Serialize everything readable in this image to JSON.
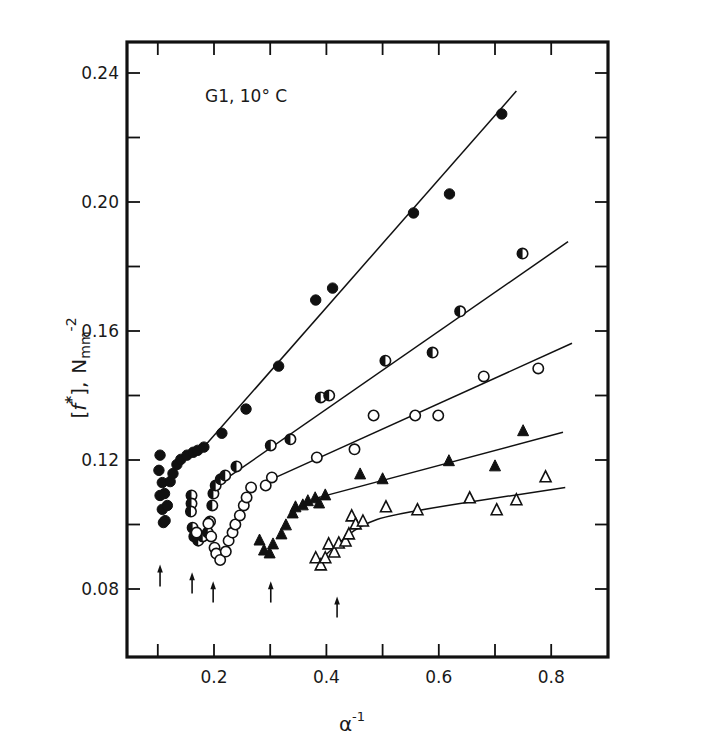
{
  "chart_data": {
    "type": "scatter",
    "title": "",
    "annotation": "G1,  10° C",
    "xlabel": "α⁻¹",
    "xlabel_base": "α",
    "xlabel_sup": "-1",
    "ylabel": "[f*], N mm⁻²",
    "ylabel_parts": {
      "bracket_open": "[",
      "f": "f",
      "star": "*",
      "bracket_close": "],",
      "unit": "N",
      "unit_sub": "mm",
      "unit_sup": "-2"
    },
    "xlim": [
      0.045,
      0.9
    ],
    "ylim": [
      0.059,
      0.25
    ],
    "x_ticks": [
      0.1,
      0.2,
      0.3,
      0.4,
      0.5,
      0.6,
      0.7,
      0.8
    ],
    "x_tick_labels": [
      {
        "value": 0.2,
        "label": "0.2"
      },
      {
        "value": 0.4,
        "label": "0.4"
      },
      {
        "value": 0.6,
        "label": "0.6"
      },
      {
        "value": 0.8,
        "label": "0.8"
      }
    ],
    "y_ticks": [
      0.08,
      0.1,
      0.12,
      0.14,
      0.16,
      0.18,
      0.2,
      0.22,
      0.24
    ],
    "y_tick_labels": [
      {
        "value": 0.24,
        "label": "0.24"
      },
      {
        "value": 0.2,
        "label": "0.20"
      },
      {
        "value": 0.16,
        "label": "0.16"
      },
      {
        "value": 0.12,
        "label": "0.12"
      },
      {
        "value": 0.08,
        "label": "0.08"
      }
    ],
    "grid": false,
    "legend": "none",
    "series": [
      {
        "name": "filled-circles",
        "marker": "filled-circle",
        "points": [
          [
            0.104,
            0.1215
          ],
          [
            0.102,
            0.1168
          ],
          [
            0.108,
            0.113
          ],
          [
            0.104,
            0.109
          ],
          [
            0.108,
            0.1047
          ],
          [
            0.11,
            0.1006
          ],
          [
            0.113,
            0.1012
          ],
          [
            0.112,
            0.1096
          ],
          [
            0.117,
            0.1059
          ],
          [
            0.122,
            0.1133
          ],
          [
            0.127,
            0.1158
          ],
          [
            0.134,
            0.1186
          ],
          [
            0.141,
            0.1202
          ],
          [
            0.152,
            0.1215
          ],
          [
            0.163,
            0.1224
          ],
          [
            0.171,
            0.123
          ],
          [
            0.182,
            0.124
          ],
          [
            0.214,
            0.1283
          ],
          [
            0.257,
            0.1358
          ],
          [
            0.315,
            0.1491
          ],
          [
            0.381,
            0.1696
          ],
          [
            0.411,
            0.1733
          ],
          [
            0.555,
            0.1966
          ],
          [
            0.619,
            0.2025
          ],
          [
            0.712,
            0.2273
          ]
        ],
        "fit_line": [
          [
            0.182,
            0.124
          ],
          [
            0.738,
            0.2344
          ]
        ]
      },
      {
        "name": "half-filled-circles",
        "marker": "half-filled-circle",
        "points": [
          [
            0.16,
            0.109
          ],
          [
            0.16,
            0.1065
          ],
          [
            0.159,
            0.104
          ],
          [
            0.162,
            0.099
          ],
          [
            0.165,
            0.0963
          ],
          [
            0.172,
            0.095
          ],
          [
            0.18,
            0.0963
          ],
          [
            0.189,
            0.0975
          ],
          [
            0.193,
            0.1009
          ],
          [
            0.197,
            0.1059
          ],
          [
            0.199,
            0.1096
          ],
          [
            0.203,
            0.1121
          ],
          [
            0.212,
            0.114
          ],
          [
            0.22,
            0.1152
          ],
          [
            0.24,
            0.118
          ],
          [
            0.301,
            0.1245
          ],
          [
            0.336,
            0.1264
          ],
          [
            0.39,
            0.1394
          ],
          [
            0.405,
            0.14
          ],
          [
            0.505,
            0.1508
          ],
          [
            0.589,
            0.1533
          ],
          [
            0.638,
            0.1661
          ],
          [
            0.749,
            0.184
          ]
        ],
        "fit_line": [
          [
            0.23,
            0.1152
          ],
          [
            0.83,
            0.1877
          ]
        ]
      },
      {
        "name": "open-circles",
        "marker": "open-circle",
        "points": [
          [
            0.169,
            0.0975
          ],
          [
            0.19,
            0.1003
          ],
          [
            0.195,
            0.0963
          ],
          [
            0.201,
            0.0928
          ],
          [
            0.204,
            0.091
          ],
          [
            0.211,
            0.089
          ],
          [
            0.221,
            0.0916
          ],
          [
            0.226,
            0.095
          ],
          [
            0.233,
            0.0975
          ],
          [
            0.238,
            0.1
          ],
          [
            0.246,
            0.1028
          ],
          [
            0.253,
            0.1059
          ],
          [
            0.258,
            0.1084
          ],
          [
            0.266,
            0.1115
          ],
          [
            0.292,
            0.1121
          ],
          [
            0.303,
            0.1146
          ],
          [
            0.383,
            0.1208
          ],
          [
            0.45,
            0.1233
          ],
          [
            0.484,
            0.1338
          ],
          [
            0.558,
            0.1338
          ],
          [
            0.599,
            0.1338
          ],
          [
            0.68,
            0.1459
          ],
          [
            0.777,
            0.1484
          ]
        ],
        "fit_line": [
          [
            0.297,
            0.1136
          ],
          [
            0.837,
            0.1562
          ]
        ]
      },
      {
        "name": "filled-triangles",
        "marker": "filled-triangle",
        "points": [
          [
            0.281,
            0.095
          ],
          [
            0.289,
            0.0919
          ],
          [
            0.299,
            0.091
          ],
          [
            0.305,
            0.0938
          ],
          [
            0.32,
            0.0969
          ],
          [
            0.328,
            0.0997
          ],
          [
            0.34,
            0.1034
          ],
          [
            0.345,
            0.1053
          ],
          [
            0.358,
            0.1059
          ],
          [
            0.367,
            0.1072
          ],
          [
            0.38,
            0.1081
          ],
          [
            0.387,
            0.1065
          ],
          [
            0.398,
            0.109
          ],
          [
            0.46,
            0.1155
          ],
          [
            0.5,
            0.114
          ],
          [
            0.618,
            0.1196
          ],
          [
            0.7,
            0.118
          ],
          [
            0.75,
            0.1289
          ]
        ],
        "fit_line": [
          [
            0.38,
            0.1081
          ],
          [
            0.821,
            0.1286
          ]
        ]
      },
      {
        "name": "open-triangles",
        "marker": "open-triangle",
        "points": [
          [
            0.381,
            0.0895
          ],
          [
            0.39,
            0.0873
          ],
          [
            0.398,
            0.0895
          ],
          [
            0.404,
            0.0938
          ],
          [
            0.414,
            0.0913
          ],
          [
            0.422,
            0.0941
          ],
          [
            0.434,
            0.0947
          ],
          [
            0.44,
            0.0969
          ],
          [
            0.445,
            0.1025
          ],
          [
            0.452,
            0.1
          ],
          [
            0.465,
            0.1009
          ],
          [
            0.506,
            0.1053
          ],
          [
            0.562,
            0.1044
          ],
          [
            0.655,
            0.1081
          ],
          [
            0.703,
            0.1044
          ],
          [
            0.738,
            0.1075
          ],
          [
            0.79,
            0.1146
          ]
        ],
        "fit_line_curve": [
          [
            0.385,
            0.0882
          ],
          [
            0.42,
            0.0941
          ],
          [
            0.46,
            0.0997
          ],
          [
            0.52,
            0.1034
          ],
          [
            0.825,
            0.1115
          ]
        ]
      }
    ],
    "arrows": [
      {
        "x": 0.104,
        "y_tail": 0.0808,
        "y_head": 0.0876
      },
      {
        "x": 0.161,
        "y_tail": 0.0786,
        "y_head": 0.0852
      },
      {
        "x": 0.1985,
        "y_tail": 0.0758,
        "y_head": 0.0824
      },
      {
        "x": 0.301,
        "y_tail": 0.0758,
        "y_head": 0.0824
      },
      {
        "x": 0.419,
        "y_tail": 0.0712,
        "y_head": 0.0777
      }
    ]
  },
  "colors": {
    "ink": "#111111",
    "background": "#ffffff"
  }
}
